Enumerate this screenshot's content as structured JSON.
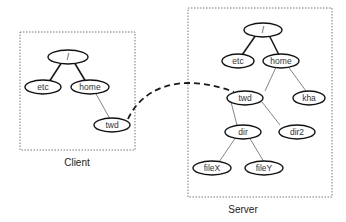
{
  "client": {
    "caption": "Client",
    "nodes": {
      "root": "/",
      "etc": "etc",
      "home": "home",
      "twd": "twd"
    }
  },
  "server": {
    "caption": "Server",
    "nodes": {
      "root": "/",
      "etc": "etc",
      "home": "home",
      "twd": "twd",
      "kha": "kha",
      "dir": "dir",
      "dir2": "dir2",
      "fileX": "fileX",
      "fileY": "fileY"
    }
  },
  "edges": {
    "client": [
      [
        "root",
        "etc"
      ],
      [
        "root",
        "home"
      ],
      [
        "home",
        "twd"
      ]
    ],
    "server": [
      [
        "root",
        "etc"
      ],
      [
        "root",
        "home"
      ],
      [
        "home",
        "twd"
      ],
      [
        "home",
        "kha"
      ],
      [
        "twd",
        "dir"
      ],
      [
        "twd",
        "dir2"
      ],
      [
        "dir",
        "fileX"
      ],
      [
        "dir",
        "fileY"
      ]
    ]
  },
  "mount_link": {
    "from": "client.twd",
    "to": "server.twd",
    "style": "dashed"
  }
}
